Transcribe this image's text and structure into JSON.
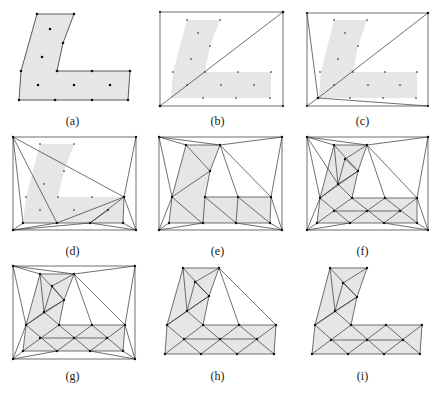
{
  "figure": {
    "panels": [
      {
        "id": "a",
        "caption": "(a)"
      },
      {
        "id": "b",
        "caption": "(b)"
      },
      {
        "id": "c",
        "caption": "(c)"
      },
      {
        "id": "d",
        "caption": "(d)"
      },
      {
        "id": "e",
        "caption": "(e)"
      },
      {
        "id": "f",
        "caption": "(f)"
      },
      {
        "id": "g",
        "caption": "(g)"
      },
      {
        "id": "h",
        "caption": "(h)"
      },
      {
        "id": "i",
        "caption": "(i)"
      }
    ],
    "fill_color": "#e6e6e6",
    "line_color": "#333333"
  }
}
